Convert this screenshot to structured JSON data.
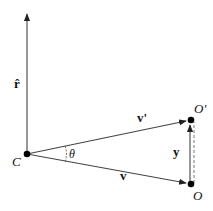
{
  "diagram": {
    "labels": {
      "r_hat": "r̂",
      "v_prime": "v'",
      "v": "v",
      "y": "y",
      "theta": "θ",
      "C": "C",
      "O_prime": "O'",
      "O": "O"
    },
    "points": {
      "C": [
        27,
        154
      ],
      "O_prime": [
        191,
        120
      ],
      "O": [
        191,
        184
      ],
      "r_tip": [
        27,
        12
      ]
    },
    "colors": {
      "stroke": "#333333",
      "point": "#000000"
    }
  }
}
